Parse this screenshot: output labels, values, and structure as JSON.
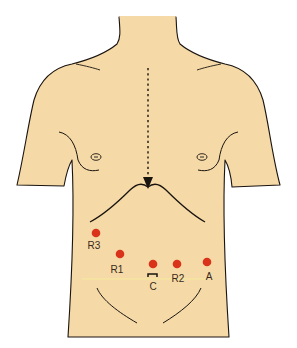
{
  "diagram": {
    "colors": {
      "skin": "#f5d9a6",
      "outline": "#1a1410",
      "port": "#d9331c",
      "guide_line": "#f6ec9e",
      "label": "#3a2a1a",
      "background": "#ffffff"
    },
    "arrow": {
      "style": "dotted",
      "direction": "down",
      "x": 148,
      "y_start": 68,
      "y_end": 183
    },
    "ports": [
      {
        "id": "R3",
        "label": "R3",
        "x": 96,
        "y": 233,
        "label_x": 94,
        "label_y": 249
      },
      {
        "id": "R1",
        "label": "R1",
        "x": 120,
        "y": 254,
        "label_x": 117,
        "label_y": 273
      },
      {
        "id": "C",
        "label": "C",
        "x": 153,
        "y": 264,
        "label_x": 153,
        "label_y": 290
      },
      {
        "id": "R2",
        "label": "R2",
        "x": 177,
        "y": 264,
        "label_x": 178,
        "label_y": 282
      },
      {
        "id": "A",
        "label": "A",
        "x": 207,
        "y": 262,
        "label_x": 209,
        "label_y": 280
      }
    ]
  }
}
